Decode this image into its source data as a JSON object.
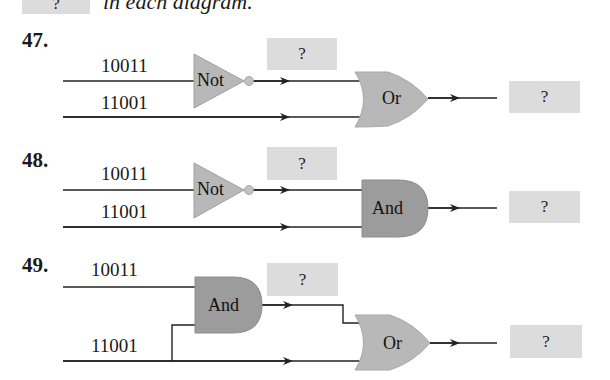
{
  "header": {
    "placeholder_box": "?",
    "instruction_text": "in each diagram."
  },
  "problems": [
    {
      "number": "47.",
      "input_top": "10011",
      "input_bottom": "11001",
      "gate1": "Not",
      "intermediate": "?",
      "gate2": "Or",
      "output": "?"
    },
    {
      "number": "48.",
      "input_top": "10011",
      "input_bottom": "11001",
      "gate1": "Not",
      "intermediate": "?",
      "gate2": "And",
      "output": "?"
    },
    {
      "number": "49.",
      "input_top": "10011",
      "input_bottom": "11001",
      "gate1": "And",
      "intermediate": "?",
      "gate2": "Or",
      "output": "?"
    }
  ],
  "colors": {
    "gate_light": "#b5b5b5",
    "gate_dark": "#9a9a9a",
    "answer_box": "#dcdcdc",
    "wire": "#222222"
  }
}
